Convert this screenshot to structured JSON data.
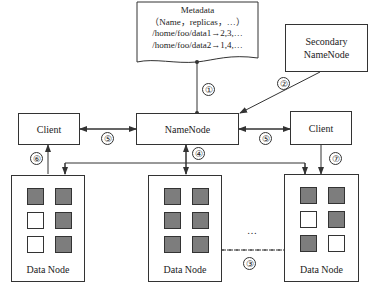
{
  "metadata": {
    "title": "Metadata",
    "line1": "（Name，replicas，…）",
    "line2": "/home/foo/data1→2,3,…",
    "line3": "/home/foo/data2→1,4,…"
  },
  "secondary_namenode": {
    "line1": "Secondary",
    "line2": "NameNode"
  },
  "namenode": {
    "label": "NameNode"
  },
  "client_left": {
    "label": "Client"
  },
  "client_right": {
    "label": "Client"
  },
  "datanodes": [
    {
      "label": "Data Node",
      "blocks": [
        "filled",
        "filled",
        "empty",
        "filled",
        "empty",
        "filled"
      ]
    },
    {
      "label": "Data Node",
      "blocks": [
        "filled",
        "filled",
        "filled",
        "filled",
        "filled",
        "filled"
      ]
    },
    {
      "label": "Data Node",
      "blocks": [
        "filled",
        "filled",
        "empty",
        "filled",
        "filled",
        "empty"
      ]
    }
  ],
  "steps": [
    "①",
    "②",
    "③",
    "④",
    "⑤",
    "⑤",
    "⑥",
    "⑦"
  ],
  "ellipsis": "…",
  "colors": {
    "line": "#333333",
    "filled_block": "#7d7d7d"
  }
}
